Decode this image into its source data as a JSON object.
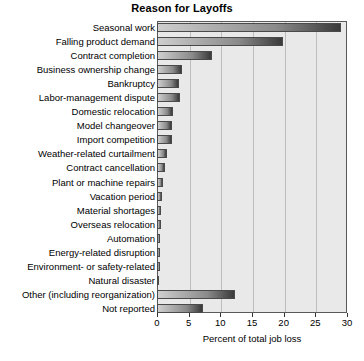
{
  "chart_data": {
    "type": "bar",
    "orientation": "horizontal",
    "title": "Reason for Layoffs",
    "xlabel": "Percent of total job loss",
    "ylabel": "",
    "xlim": [
      0,
      30
    ],
    "xticks": [
      0,
      5,
      10,
      15,
      20,
      25,
      30
    ],
    "xtick_labels": [
      "0",
      "5",
      "10",
      "15",
      "20",
      "25",
      "30"
    ],
    "grid": true,
    "legend": null,
    "categories": [
      "Seasonal work",
      "Falling product demand",
      "Contract completion",
      "Business ownership change",
      "Bankruptcy",
      "Labor-management dispute",
      "Domestic relocation",
      "Model changeover",
      "Import competition",
      "Weather-related curtailment",
      "Contract cancellation",
      "Plant or machine repairs",
      "Vacation period",
      "Material shortages",
      "Overseas relocation",
      "Automation",
      "Energy-related disruption",
      "Environment- or safety-related",
      "Natural disaster",
      "Other (including reorganization)",
      "Not reported"
    ],
    "values": [
      29.1,
      19.9,
      8.7,
      3.9,
      3.4,
      3.6,
      2.6,
      2.4,
      2.4,
      1.6,
      1.2,
      0.9,
      0.8,
      0.7,
      0.6,
      0.5,
      0.4,
      0.4,
      0.3,
      12.3,
      7.3
    ]
  },
  "style": {
    "plot_background": "#e9e9e9",
    "bar_color_light": "#cfcfcf",
    "bar_color_dark": "#3a3a3a",
    "gridline_color": "#bdbdbd",
    "axis_color": "#5a5a5a",
    "text_color": "#000000"
  }
}
